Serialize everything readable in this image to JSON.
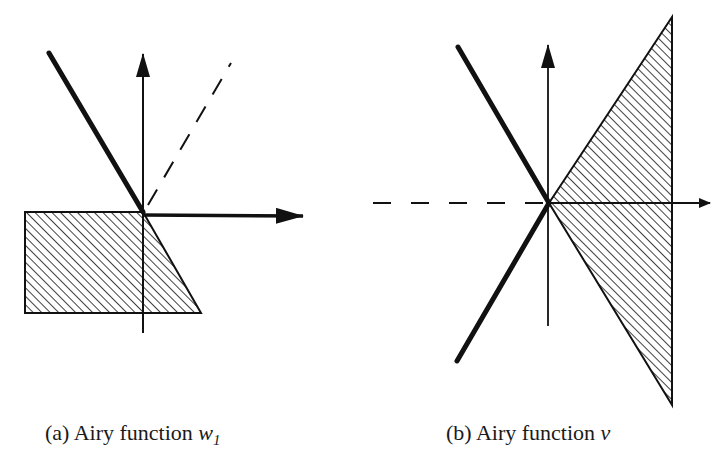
{
  "figure": {
    "panels": [
      {
        "id": "a",
        "caption_prefix": "(a) Airy function ",
        "caption_var": "w",
        "caption_sub": "1",
        "elements": [
          "vertical-axis-arrow",
          "horizontal-axis-arrow",
          "thick-ray",
          "dashed-ray",
          "hatched-region"
        ]
      },
      {
        "id": "b",
        "caption_prefix": "(b) Airy function ",
        "caption_var": "v",
        "caption_sub": "",
        "elements": [
          "vertical-axis-arrow",
          "horizontal-axis-arrow",
          "thick-ray-upper",
          "thick-ray-lower",
          "dashed-negative-axis",
          "hatched-region"
        ]
      }
    ],
    "colors": {
      "ink": "#111111",
      "background": "#ffffff"
    }
  }
}
